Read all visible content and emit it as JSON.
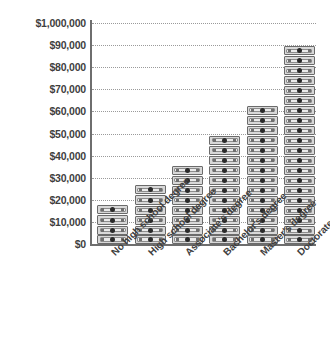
{
  "chart_data": {
    "type": "bar",
    "title": "",
    "subtitle": "",
    "xlabel": "",
    "ylabel": "",
    "categories": [
      "No high school degree",
      "High school degree",
      "Associate's degree",
      "Bachelor's degree",
      "Master's degree",
      "Doctorate"
    ],
    "values": [
      18000,
      27000,
      36000,
      49500,
      63000,
      90000
    ],
    "value_labels": [
      "$18,000",
      "$27,000",
      "$36,000",
      "$49,500",
      "$63,000",
      "$90,000"
    ],
    "series": [
      {
        "name": "Median annual earnings",
        "values": [
          18000,
          27000,
          36000,
          49500,
          63000,
          90000
        ]
      }
    ],
    "pictogram": {
      "icon": "dollar-bill-icon",
      "unit_value": 4500,
      "counts": [
        4,
        6,
        8,
        11,
        14,
        20
      ]
    },
    "ytick_labels": [
      "$0",
      "$10,000",
      "$20,000",
      "$30,000",
      "$40,000",
      "$50,000",
      "$60,000",
      "$70,000",
      "$80,000",
      "$90,000",
      "$1,000,000"
    ],
    "ytick_values": [
      0,
      10000,
      20000,
      30000,
      40000,
      50000,
      60000,
      70000,
      80000,
      90000,
      100000
    ],
    "ylim": [
      0,
      100000
    ],
    "grid": true,
    "legend": "none",
    "legend_position": "none",
    "colors": {
      "bar_fill": "#d8d8d8",
      "bar_stroke": "#6b6b6b",
      "bar_inner": "#eaeaea",
      "axis": "#6e6e6e",
      "grid": "#9a9a9a",
      "text": "#3f3f3f",
      "background": "#ffffff"
    }
  }
}
